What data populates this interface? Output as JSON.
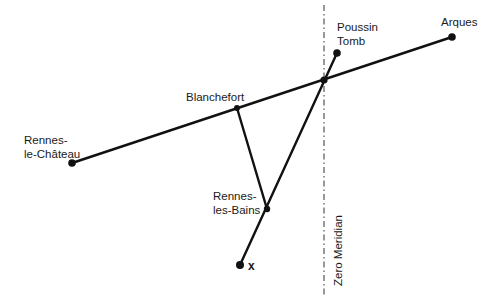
{
  "diagram": {
    "type": "geometric-map",
    "colors": {
      "line": "#111111",
      "text": "#1a1a1a",
      "background": "#ffffff"
    },
    "points": {
      "rennes_le_chateau": {
        "label_line1": "Rennes-",
        "label_line2": "le-Château",
        "x": 72,
        "y": 163
      },
      "blanchefort": {
        "label": "Blanchefort",
        "x": 237,
        "y": 108
      },
      "rennes_les_bains": {
        "label_line1": "Rennes-",
        "label_line2": "les-Bains",
        "x": 267,
        "y": 209
      },
      "x_point": {
        "label": "x",
        "x": 240,
        "y": 265
      },
      "poussin_tomb": {
        "label_line1": "Poussin",
        "label_line2": "Tomb",
        "x": 337,
        "y": 53
      },
      "arques": {
        "label": "Arques",
        "x": 452,
        "y": 37
      },
      "intersection": {
        "x": 324,
        "y": 80
      }
    },
    "meridian": {
      "label": "Zero Meridian",
      "x": 324,
      "y_top": 5,
      "y_bottom": 296
    },
    "lines": [
      {
        "from": "rennes_le_chateau",
        "to": "arques"
      },
      {
        "from": "blanchefort",
        "to": "rennes_les_bains"
      },
      {
        "from": "x_point",
        "to": "poussin_tomb"
      }
    ]
  }
}
